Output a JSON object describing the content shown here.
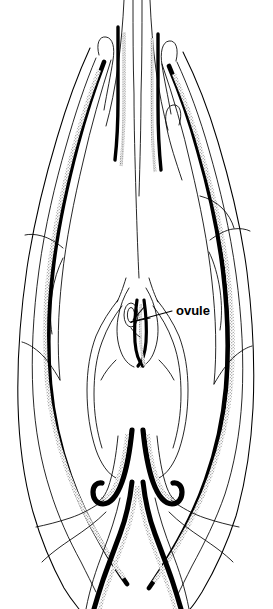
{
  "figure": {
    "kind": "botanical-line-drawing",
    "view": "longitudinal section",
    "background_color": "#ffffff",
    "ink_color": "#000000",
    "stipple_color": "#6b6b6b",
    "width_px": 273,
    "height_px": 609
  },
  "labels": [
    {
      "id": "ovule",
      "text": "ovule",
      "x": 176,
      "y": 312,
      "font_size_px": 13,
      "bold": true,
      "leader": {
        "from_x": 172,
        "from_y": 312,
        "to_x": 131,
        "to_y": 322
      }
    }
  ],
  "structures": [
    {
      "name": "style-and-filaments",
      "region": "top",
      "description": "slender elongated organs extending beyond upper edge"
    },
    {
      "name": "left-perianth-lobe",
      "region": "upper-left",
      "description": "recurved hooked tip with stippled band"
    },
    {
      "name": "right-perianth-lobe",
      "region": "upper-right",
      "description": "recurved hooked tip with stippled band"
    },
    {
      "name": "left-outer-wall",
      "region": "left",
      "description": "long tapering wall with solid black and stipple shading"
    },
    {
      "name": "right-outer-wall",
      "region": "right",
      "description": "long tapering wall with solid black and stipple shading"
    },
    {
      "name": "ovary-chamber",
      "region": "center",
      "description": "bell-shaped locule enclosing the ovule"
    },
    {
      "name": "ovule",
      "region": "center",
      "description": "small oval body inside ovary chamber"
    },
    {
      "name": "recurved-lobes",
      "region": "lower-center",
      "description": "paired hook-shaped inward-curling lobes"
    },
    {
      "name": "pedicel",
      "region": "bottom",
      "description": "converging stalk extending to lower edge"
    }
  ]
}
